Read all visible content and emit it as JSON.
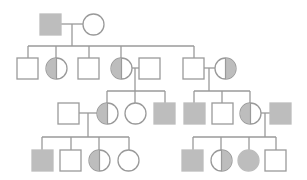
{
  "colors": {
    "line": "#9a9a9a",
    "fill": "#bdbdbd",
    "bg": "#ffffff"
  },
  "size": 21,
  "individuals": [
    {
      "id": "I-1",
      "gen": 1,
      "sex": "male",
      "status": "affected",
      "x": 40,
      "y": 14
    },
    {
      "id": "I-2",
      "gen": 1,
      "sex": "female",
      "status": "unaffected",
      "x": 83,
      "y": 14
    },
    {
      "id": "II-1",
      "gen": 2,
      "sex": "male",
      "status": "unaffected",
      "x": 17,
      "y": 58
    },
    {
      "id": "II-2",
      "gen": 2,
      "sex": "female",
      "status": "carrier-left",
      "x": 46,
      "y": 58
    },
    {
      "id": "II-3",
      "gen": 2,
      "sex": "male",
      "status": "unaffected",
      "x": 78,
      "y": 58
    },
    {
      "id": "II-4",
      "gen": 2,
      "sex": "female",
      "status": "carrier-left",
      "x": 111,
      "y": 58
    },
    {
      "id": "II-5",
      "gen": 2,
      "sex": "male",
      "status": "unaffected",
      "x": 139,
      "y": 58
    },
    {
      "id": "II-6",
      "gen": 2,
      "sex": "male",
      "status": "unaffected",
      "x": 183,
      "y": 58
    },
    {
      "id": "II-7",
      "gen": 2,
      "sex": "female",
      "status": "carrier-right",
      "x": 215,
      "y": 58
    },
    {
      "id": "III-1",
      "gen": 3,
      "sex": "male",
      "status": "unaffected",
      "x": 58,
      "y": 103
    },
    {
      "id": "III-2",
      "gen": 3,
      "sex": "female",
      "status": "carrier-left",
      "x": 97,
      "y": 103
    },
    {
      "id": "III-3",
      "gen": 3,
      "sex": "female",
      "status": "unaffected",
      "x": 125,
      "y": 103
    },
    {
      "id": "III-4",
      "gen": 3,
      "sex": "male",
      "status": "affected",
      "x": 154,
      "y": 103
    },
    {
      "id": "III-5",
      "gen": 3,
      "sex": "male",
      "status": "affected",
      "x": 184,
      "y": 103
    },
    {
      "id": "III-6",
      "gen": 3,
      "sex": "male",
      "status": "unaffected",
      "x": 212,
      "y": 103
    },
    {
      "id": "III-7",
      "gen": 3,
      "sex": "female",
      "status": "carrier-left",
      "x": 240,
      "y": 103
    },
    {
      "id": "III-8",
      "gen": 3,
      "sex": "male",
      "status": "affected",
      "x": 270,
      "y": 103
    },
    {
      "id": "IV-1",
      "gen": 4,
      "sex": "male",
      "status": "affected",
      "x": 32,
      "y": 150
    },
    {
      "id": "IV-2",
      "gen": 4,
      "sex": "male",
      "status": "unaffected",
      "x": 60,
      "y": 150
    },
    {
      "id": "IV-3",
      "gen": 4,
      "sex": "female",
      "status": "carrier-left",
      "x": 89,
      "y": 150
    },
    {
      "id": "IV-4",
      "gen": 4,
      "sex": "female",
      "status": "unaffected",
      "x": 118,
      "y": 150
    },
    {
      "id": "IV-5",
      "gen": 4,
      "sex": "male",
      "status": "affected",
      "x": 182,
      "y": 150
    },
    {
      "id": "IV-6",
      "gen": 4,
      "sex": "female",
      "status": "carrier-right",
      "x": 211,
      "y": 150
    },
    {
      "id": "IV-7",
      "gen": 4,
      "sex": "female",
      "status": "affected",
      "x": 238,
      "y": 150
    },
    {
      "id": "IV-8",
      "gen": 4,
      "sex": "male",
      "status": "unaffected",
      "x": 265,
      "y": 150
    }
  ],
  "lines": [
    [
      61,
      24,
      83,
      24
    ],
    [
      72,
      24,
      72,
      46
    ],
    [
      28,
      46,
      194,
      46
    ],
    [
      28,
      46,
      28,
      58
    ],
    [
      56,
      46,
      56,
      58
    ],
    [
      89,
      46,
      89,
      58
    ],
    [
      121,
      46,
      121,
      58
    ],
    [
      194,
      46,
      194,
      58
    ],
    [
      132,
      68,
      139,
      68
    ],
    [
      135,
      68,
      135,
      91
    ],
    [
      107,
      91,
      165,
      91
    ],
    [
      107,
      91,
      107,
      103
    ],
    [
      135,
      91,
      135,
      103
    ],
    [
      165,
      91,
      165,
      103
    ],
    [
      204,
      68,
      215,
      68
    ],
    [
      209,
      68,
      209,
      91
    ],
    [
      194,
      91,
      250,
      91
    ],
    [
      194,
      91,
      194,
      103
    ],
    [
      222,
      91,
      222,
      103
    ],
    [
      250,
      91,
      250,
      103
    ],
    [
      79,
      113,
      97,
      113
    ],
    [
      88,
      113,
      88,
      137
    ],
    [
      42,
      137,
      129,
      137
    ],
    [
      42,
      137,
      42,
      150
    ],
    [
      71,
      137,
      71,
      150
    ],
    [
      99,
      137,
      99,
      150
    ],
    [
      129,
      137,
      129,
      150
    ],
    [
      261,
      113,
      270,
      113
    ],
    [
      265,
      113,
      265,
      137
    ],
    [
      193,
      137,
      276,
      137
    ],
    [
      193,
      137,
      193,
      150
    ],
    [
      221,
      137,
      221,
      150
    ],
    [
      249,
      137,
      249,
      150
    ],
    [
      276,
      137,
      276,
      150
    ]
  ]
}
